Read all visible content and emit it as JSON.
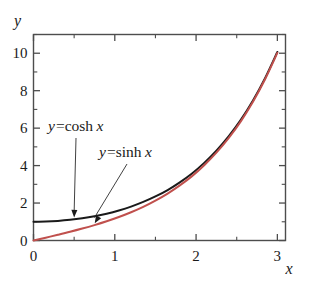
{
  "figure": {
    "title": "",
    "background_color": "#ffffff"
  },
  "axes": {
    "x_label": "x",
    "y_label": "y",
    "x_ticks": [
      "0",
      "1",
      "2",
      "3"
    ],
    "y_ticks": [
      "0",
      "2",
      "4",
      "6",
      "8",
      "10"
    ],
    "frame_color": "#4d4d4d"
  },
  "annotations": {
    "cosh_label": "y=cosh x",
    "cosh_label_parts": {
      "y": "y",
      "eq": "=",
      "fn": "cosh",
      "var": "x"
    },
    "sinh_label": "y=sinh x",
    "sinh_label_parts": {
      "y": "y",
      "eq": "=",
      "fn": "sinh",
      "var": "x"
    }
  },
  "chart_data": {
    "type": "line",
    "title": "",
    "xlabel": "x",
    "ylabel": "y",
    "xlim": [
      0,
      3.1
    ],
    "ylim": [
      0,
      11
    ],
    "grid": false,
    "legend": "annotations-with-arrows",
    "x_ticks_major": [
      0,
      1,
      2,
      3
    ],
    "x_ticks_minor": [
      0.5,
      1.5,
      2.5
    ],
    "y_ticks_major": [
      0,
      2,
      4,
      6,
      8,
      10
    ],
    "y_ticks_minor": [
      1,
      3,
      5,
      7,
      9,
      11
    ],
    "series": [
      {
        "name": "y=cosh x",
        "color": "#1a1a1a",
        "x": [
          0,
          0.15,
          0.3,
          0.45,
          0.6,
          0.75,
          0.9,
          1.05,
          1.2,
          1.35,
          1.5,
          1.65,
          1.8,
          1.95,
          2.1,
          2.25,
          2.4,
          2.55,
          2.7,
          2.85,
          3.0
        ],
        "values": [
          1.0,
          1.011,
          1.045,
          1.103,
          1.185,
          1.294,
          1.433,
          1.604,
          1.811,
          2.06,
          2.352,
          2.696,
          3.107,
          3.58,
          4.144,
          4.797,
          5.557,
          6.44,
          7.473,
          8.678,
          10.068
        ]
      },
      {
        "name": "y=sinh x",
        "color": "#c0504d",
        "x": [
          0,
          0.15,
          0.3,
          0.45,
          0.6,
          0.75,
          0.9,
          1.05,
          1.2,
          1.35,
          1.5,
          1.65,
          1.8,
          1.95,
          2.1,
          2.25,
          2.4,
          2.55,
          2.7,
          2.85,
          3.0
        ],
        "values": [
          0.0,
          0.151,
          0.305,
          0.465,
          0.637,
          0.822,
          1.027,
          1.254,
          1.509,
          1.797,
          2.129,
          2.505,
          2.942,
          3.438,
          4.022,
          4.691,
          5.466,
          6.362,
          7.406,
          8.621,
          10.018
        ]
      }
    ],
    "annotations": [
      {
        "text": "y=cosh x",
        "target_x": 0.5,
        "target_y": 1.128,
        "label_x": 0.18,
        "label_y": 6.6
      },
      {
        "text": "y=sinh x",
        "target_x": 0.75,
        "target_y": 0.822,
        "label_x": 0.95,
        "label_y": 5.2
      }
    ]
  }
}
